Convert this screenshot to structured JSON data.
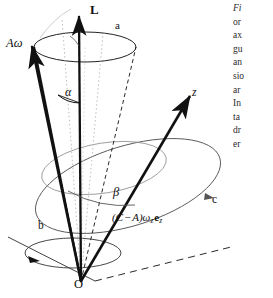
{
  "figure": {
    "type": "vector-mechanics-diagram",
    "background": "#ffffff",
    "ink_color": "#111111",
    "faint_color": "#9a9a9a",
    "labels": {
      "angular_momentum": "L",
      "angular_velocity": "Aω",
      "axis_a": "a",
      "axis_b": "b",
      "axis_c": "c",
      "axis_z": "z",
      "angle_alpha": "α",
      "angle_beta": "β",
      "origin": "O",
      "vector_expression_open": "(C",
      "vector_expression_minus": "−",
      "vector_expression_A": "A",
      "vector_expression_close": ")ω",
      "vector_expression_sub1": "z",
      "vector_expression_e": "e",
      "vector_expression_sub2": "z",
      "vector_expression_full": "(C − A)ω z e z"
    }
  },
  "caption": {
    "clipped": true,
    "lines": [
      {
        "text": "Fi",
        "italic": true
      },
      {
        "text": "or",
        "italic": false
      },
      {
        "text": "ax",
        "italic": false
      },
      {
        "text": "gu",
        "italic": false
      },
      {
        "text": "an",
        "italic": false
      },
      {
        "text": "sio",
        "italic": false
      },
      {
        "text": "ar",
        "italic": false
      },
      {
        "text": "In",
        "italic": false
      },
      {
        "text": "ta",
        "italic": false
      },
      {
        "text": "dr",
        "italic": false
      },
      {
        "text": "er",
        "italic": false
      }
    ]
  }
}
